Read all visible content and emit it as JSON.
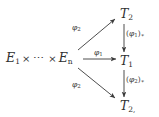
{
  "diagram": {
    "kind": "commutative-diagram",
    "background_color": "#ffffff",
    "ink_color": "#2f2f2f",
    "source": {
      "first_factor": "E",
      "first_factor_sub": "1",
      "times_1": "×",
      "ellipsis": "⋯",
      "times_2": "×",
      "last_factor": "E",
      "last_factor_sub": "n"
    },
    "targets": [
      {
        "name": "T",
        "sub": "2",
        "position": "top-right"
      },
      {
        "name": "T",
        "sub": "1",
        "position": "middle-right"
      },
      {
        "name": "T",
        "sub": "2,",
        "position": "bottom-right"
      }
    ],
    "edges": [
      {
        "id": "diagonal-up",
        "from": "E1-x-dots-x-En",
        "to": "T2-top",
        "label_phi": "φ",
        "label_sub": "2",
        "direction": "up-right"
      },
      {
        "id": "horizontal",
        "from": "E1-x-dots-x-En",
        "to": "T1-middle",
        "label_phi": "φ",
        "label_sub": "1",
        "direction": "right"
      },
      {
        "id": "diagonal-down",
        "from": "E1-x-dots-x-En",
        "to": "T2-bottom",
        "label_phi": "φ",
        "label_sub": "2",
        "direction": "down-right"
      },
      {
        "id": "vertical-upper",
        "from": "T2-top",
        "to": "T1-middle",
        "label_open": "(",
        "label_phi": "φ",
        "label_sub": "1",
        "label_close": ")",
        "label_star": "∗",
        "direction": "down"
      },
      {
        "id": "vertical-lower",
        "from": "T1-middle",
        "to": "T2-bottom",
        "label_open": "(",
        "label_phi": "φ",
        "label_sub": "2",
        "label_close": ")",
        "label_star": "∗",
        "direction": "down"
      }
    ]
  }
}
